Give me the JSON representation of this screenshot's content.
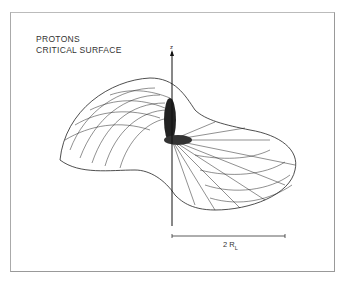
{
  "figure": {
    "title_line1": "PROTONS",
    "title_line2": "CRITICAL SURFACE",
    "axis_label": "z",
    "scale_bar_label": "2 R",
    "scale_bar_subscript": "L",
    "colors": {
      "ink": "#222222",
      "frame": "#999999",
      "background": "#ffffff"
    }
  }
}
